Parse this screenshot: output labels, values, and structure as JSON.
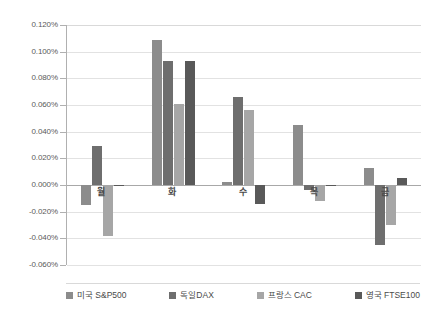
{
  "chart_data": {
    "type": "bar",
    "title": "",
    "subtitle": "",
    "xlabel": "",
    "ylabel": "",
    "categories": [
      "월",
      "화",
      "수",
      "목",
      "금"
    ],
    "series": [
      {
        "name": "미국 S&P500",
        "color": "#8c8c8c",
        "values": [
          -0.015,
          0.109,
          0.002,
          0.045,
          0.013
        ]
      },
      {
        "name": "독일DAX",
        "color": "#6e6e6e",
        "values": [
          0.029,
          0.093,
          0.066,
          -0.004,
          -0.045
        ]
      },
      {
        "name": "프랑스 CAC",
        "color": "#a6a6a6",
        "values": [
          -0.038,
          0.061,
          0.056,
          -0.012,
          -0.03
        ]
      },
      {
        "name": "영국 FTSE100",
        "color": "#595959",
        "values": [
          -0.001,
          0.093,
          -0.014,
          -0.001,
          0.005
        ]
      }
    ],
    "ylim": [
      -0.06,
      0.12
    ],
    "ytick_step": 0.02,
    "ytick_labels": [
      "0.120%",
      "0.100%",
      "0.080%",
      "0.060%",
      "0.040%",
      "0.020%",
      "0.000%",
      "-0.020%",
      "-0.040%",
      "-0.060%"
    ],
    "ytick_values": [
      0.12,
      0.1,
      0.08,
      0.06,
      0.04,
      0.02,
      0.0,
      -0.02,
      -0.04,
      -0.06
    ],
    "grid": true,
    "grid_axis": "y",
    "legend_position": "bottom",
    "value_unit": "%"
  }
}
